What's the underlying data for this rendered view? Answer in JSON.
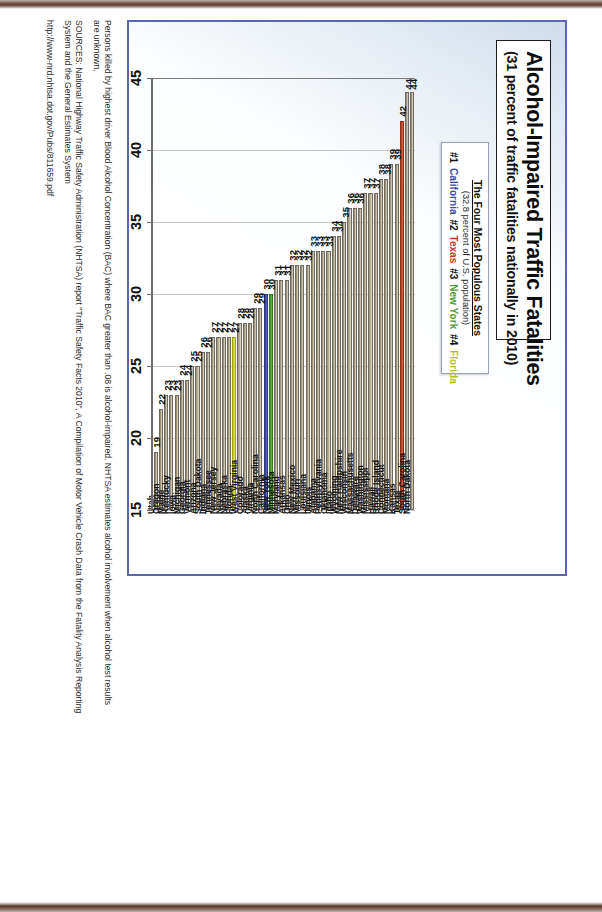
{
  "chart_title": "Alcohol-Impaired Traffic Fatalities",
  "chart_subtitle": "(31 percent of traffic fatalities nationally in 2010)",
  "legend": {
    "heading": "The Four Most Populous States",
    "subheading": "(32.8 percent of U.S. population)",
    "items": [
      {
        "rank": "#1",
        "state": "California",
        "color": "#3b4ba0"
      },
      {
        "rank": "#2",
        "state": "Texas",
        "color": "#c0392b"
      },
      {
        "rank": "#3",
        "state": "New York",
        "color": "#4f9b35"
      },
      {
        "rank": "#4",
        "state": "Florida",
        "color": "#b6bf2a"
      }
    ]
  },
  "notes": {
    "note1_line1": "Persons killed by highest driver Blood Alcohol Concentration (BAC) where BAC greater than .08 is alcohol-impaired.  NHTSA estimates alcohol involvement when alcohol test results",
    "note1_line2": "are unknown.",
    "note2_line1": "SOURCES: National Highway Traffic Safety Administration (NHTSA) report \"Traffic Safety Facts 2010\", A Compilation of Motor Vehicle Crash Data from the Fatality Analysis Reporting",
    "note2_line2": "System and the General Estimates System",
    "url": "http://www-nrd.nhtsa.dot.gov/Pubs/811659.pdf"
  },
  "chart_data": {
    "type": "bar",
    "orientation": "horizontal",
    "title": "Alcohol-Impaired Traffic Fatalities",
    "subtitle": "(31 percent of traffic fatalities nationally in 2010)",
    "xlabel": "percent",
    "ylabel": "",
    "xlim": [
      15,
      45
    ],
    "xticks": [
      45,
      40,
      35,
      30,
      25,
      20,
      15
    ],
    "grid": true,
    "legend_position": "top-center",
    "categories": [
      "North Dakota",
      "South Carolina",
      "Texas",
      "Kansas",
      "Montana",
      "Connecticut",
      "Rhode Island",
      "Hawaii",
      "Mississippi",
      "Washington",
      "Delaware",
      "Massachusetts",
      "Wisconsin",
      "New Hampshire",
      "Wyoming",
      "Idaho",
      "Oklahoma",
      "Pennsylvania",
      "Alabama",
      "Illinois",
      "Louisiana",
      "Missouri",
      "New Mexico",
      "Ohio",
      "Arkansas",
      "Maryland",
      "Minnesota",
      "New York",
      "California",
      "North Carolina",
      "Virginia",
      "Alaska",
      "Colorado",
      "West Virginia",
      "Florida",
      "Nebraska",
      "Nevada",
      "New Jersey",
      "Tennessee",
      "Indiana",
      "South Dakota",
      "Arizona",
      "Vermont",
      "Georgia",
      "Michigan",
      "Iowa",
      "Kentucky",
      "Maine",
      "Oregon",
      "Utah"
    ],
    "values": [
      44,
      44,
      42,
      39,
      39,
      38,
      38,
      37,
      37,
      37,
      36,
      36,
      36,
      35,
      34,
      34,
      33,
      33,
      33,
      33,
      32,
      32,
      32,
      32,
      31,
      31,
      31,
      30,
      30,
      29,
      29,
      28,
      28,
      28,
      27,
      27,
      27,
      27,
      27,
      26,
      26,
      25,
      25,
      24,
      24,
      23,
      23,
      23,
      22,
      19
    ],
    "highlight_colors": {
      "California": "#3b4ba0",
      "Texas": "#c0392b",
      "New York": "#4f9b35",
      "Florida": "#b6bf2a"
    },
    "default_bar_color": "#b4a992",
    "note": "Values are percent of traffic fatalities that were alcohol-impaired, by state, 2010."
  }
}
